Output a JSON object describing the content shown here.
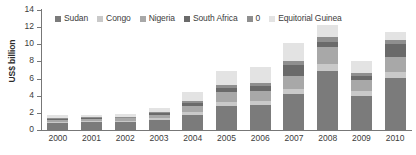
{
  "chart_data": {
    "type": "bar",
    "stacked": true,
    "title": "",
    "subtitle": "",
    "xlabel": "",
    "ylabel": "US$ billion",
    "ylim": [
      0,
      14
    ],
    "ytick_step": 2,
    "yticks": [
      "14",
      "12",
      "10",
      "8",
      "6",
      "4",
      "2",
      "0"
    ],
    "grid": false,
    "legend_position": "top",
    "categories": [
      "2000",
      "2001",
      "2002",
      "2003",
      "2004",
      "2005",
      "2006",
      "2007",
      "2008",
      "2009",
      "2010"
    ],
    "series": [
      {
        "name": "Sudan",
        "color": "#7b7b7b",
        "values": [
          0.8,
          0.9,
          0.9,
          1.2,
          1.8,
          2.8,
          2.9,
          4.2,
          6.9,
          4.0,
          6.1
        ]
      },
      {
        "name": "Congo",
        "color": "#c9c9c9",
        "values": [
          0.15,
          0.15,
          0.15,
          0.2,
          0.35,
          0.5,
          0.5,
          0.6,
          0.8,
          0.5,
          0.7
        ]
      },
      {
        "name": "Nigeria",
        "color": "#a8a8a8",
        "values": [
          0.25,
          0.25,
          0.3,
          0.4,
          0.7,
          1.1,
          1.2,
          1.5,
          2.0,
          1.3,
          1.7
        ]
      },
      {
        "name": "South Africa",
        "color": "#6a6a6a",
        "values": [
          0.1,
          0.1,
          0.1,
          0.15,
          0.3,
          0.45,
          0.5,
          1.3,
          0.6,
          0.5,
          1.5
        ]
      },
      {
        "name": "0",
        "color": "#8f8f8f",
        "values": [
          0.1,
          0.1,
          0.1,
          0.15,
          0.25,
          0.35,
          0.4,
          0.5,
          0.5,
          0.4,
          0.5
        ]
      },
      {
        "name": "Equitorial Guinea",
        "color": "#e3e3e3",
        "values": [
          0.3,
          0.3,
          0.35,
          0.5,
          1.0,
          1.7,
          1.8,
          2.0,
          1.4,
          1.4,
          0.9
        ]
      }
    ],
    "totals": [
      1.7,
      1.8,
      1.9,
      2.6,
      4.4,
      6.9,
      7.3,
      10.1,
      12.2,
      8.1,
      11.4
    ]
  }
}
